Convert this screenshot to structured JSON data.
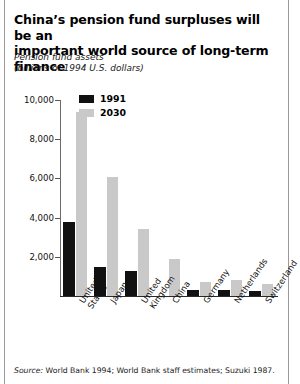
{
  "title": {
    "line1": "China’s pension fund surpluses will be an",
    "line2": "important world source of long-term finance"
  },
  "subtitle": {
    "line1": "Pension fund assets",
    "line2": "(billions of 1994 U.S. dollars)"
  },
  "legend": {
    "items": [
      {
        "label": "1991",
        "color": "#111111"
      },
      {
        "label": "2030",
        "color": "#c9c9c9"
      }
    ]
  },
  "source": {
    "prefix": "Source:",
    "text": " World Bank 1994; World Bank staff estimates; Suzuki 1987."
  },
  "chart_data": {
    "type": "bar",
    "title": "China’s pension fund surpluses will be an important world source of long-term finance",
    "subtitle": "Pension fund assets (billions of 1994 U.S. dollars)",
    "xlabel": "",
    "ylabel": "Pension fund assets (billions of 1994 U.S. dollars)",
    "ylim": [
      0,
      10000
    ],
    "yticks": [
      2000,
      4000,
      6000,
      8000,
      10000
    ],
    "ytick_labels": [
      "2,000",
      "4,000",
      "6,000",
      "8,000",
      "10,000"
    ],
    "grid": false,
    "legend_position": "top-left-inside",
    "categories": [
      "United States",
      "Japan",
      "United Kingdom",
      "China",
      "Germany",
      "Netherlands",
      "Switzerland"
    ],
    "series": [
      {
        "name": "1991",
        "color": "#111111",
        "values": [
          3800,
          1500,
          1300,
          0,
          300,
          300,
          250
        ]
      },
      {
        "name": "2030",
        "color": "#c9c9c9",
        "values": [
          9400,
          6050,
          3400,
          1900,
          700,
          800,
          600
        ]
      }
    ]
  }
}
